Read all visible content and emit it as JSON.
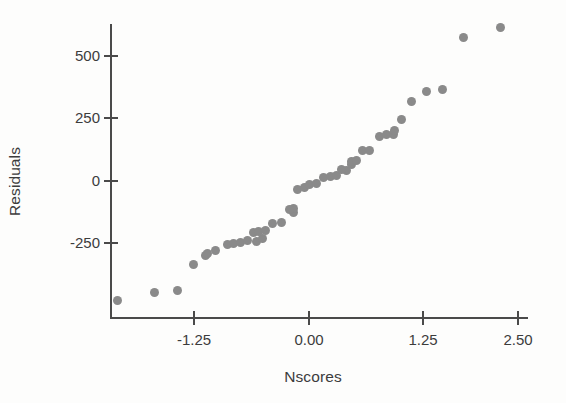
{
  "figure": {
    "kind": "scatter-plot",
    "background": "#fdfdfc",
    "point_color": "#8a8a8a",
    "axis_color": "#4a4a4a"
  },
  "axes": {
    "x_label": "Nscores",
    "y_label": "Residuals",
    "x_ticks": [
      "-1.25",
      "0.00",
      "1.25",
      "2.50"
    ],
    "y_ticks": [
      "500",
      "250",
      "0",
      "-250"
    ]
  },
  "chart_data": {
    "type": "scatter",
    "title": "",
    "xlabel": "Nscores",
    "ylabel": "Residuals",
    "xlim": [
      -2.05,
      2.7
    ],
    "ylim": [
      -560,
      700
    ],
    "xticks": [
      -1.25,
      0.0,
      1.25,
      2.5
    ],
    "yticks": [
      -250,
      0,
      250,
      500
    ],
    "grid": false,
    "legend": null,
    "n_points": 45,
    "series": [
      {
        "name": "Residuals vs Nscores",
        "color": "#8a8a8a",
        "marker": "circle",
        "points": [
          [
            -2.09,
            -484
          ],
          [
            -1.68,
            -450
          ],
          [
            -1.43,
            -443
          ],
          [
            -1.26,
            -339
          ],
          [
            -1.12,
            -302
          ],
          [
            -1.1,
            -294
          ],
          [
            -1.01,
            -283
          ],
          [
            -0.88,
            -259
          ],
          [
            -0.82,
            -253
          ],
          [
            -0.74,
            -251
          ],
          [
            -0.66,
            -244
          ],
          [
            -0.57,
            -245
          ],
          [
            -0.5,
            -234
          ],
          [
            -0.6,
            -211
          ],
          [
            -0.54,
            -207
          ],
          [
            -0.47,
            -203
          ],
          [
            -0.39,
            -176
          ],
          [
            -0.29,
            -171
          ],
          [
            -0.16,
            -131
          ],
          [
            -0.16,
            -113
          ],
          [
            -0.11,
            -40
          ],
          [
            -0.04,
            -29
          ],
          [
            0.02,
            -20
          ],
          [
            0.09,
            -13
          ],
          [
            0.17,
            11
          ],
          [
            0.25,
            16
          ],
          [
            0.31,
            20
          ],
          [
            0.42,
            40
          ],
          [
            0.48,
            64
          ],
          [
            0.37,
            43
          ],
          [
            0.48,
            74
          ],
          [
            0.53,
            80
          ],
          [
            0.6,
            117
          ],
          [
            0.67,
            120
          ],
          [
            0.78,
            176
          ],
          [
            0.86,
            181
          ],
          [
            0.94,
            184
          ],
          [
            0.95,
            198
          ],
          [
            1.02,
            241
          ],
          [
            1.14,
            314
          ],
          [
            1.3,
            354
          ],
          [
            1.47,
            362
          ],
          [
            1.7,
            572
          ],
          [
            2.11,
            612
          ],
          [
            -0.2,
            -117
          ]
        ]
      }
    ]
  }
}
